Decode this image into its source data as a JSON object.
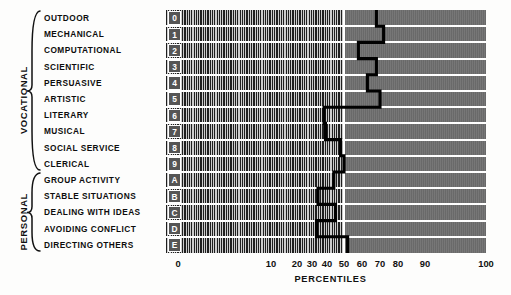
{
  "groups": [
    {
      "name": "VOCATIONAL",
      "start_row": 0,
      "end_row": 9
    },
    {
      "name": "PERSONAL",
      "start_row": 10,
      "end_row": 14
    }
  ],
  "rows": [
    {
      "code": "0",
      "label": "OUTDOOR"
    },
    {
      "code": "1",
      "label": "MECHANICAL"
    },
    {
      "code": "2",
      "label": "COMPUTATIONAL"
    },
    {
      "code": "3",
      "label": "SCIENTIFIC"
    },
    {
      "code": "4",
      "label": "PERSUASIVE"
    },
    {
      "code": "5",
      "label": "ARTISTIC"
    },
    {
      "code": "6",
      "label": "LITERARY"
    },
    {
      "code": "7",
      "label": "MUSICAL"
    },
    {
      "code": "8",
      "label": "SOCIAL SERVICE"
    },
    {
      "code": "9",
      "label": "CLERICAL"
    },
    {
      "code": "A",
      "label": "GROUP ACTIVITY"
    },
    {
      "code": "B",
      "label": "STABLE SITUATIONS"
    },
    {
      "code": "C",
      "label": "DEALING WITH IDEAS"
    },
    {
      "code": "D",
      "label": "AVOIDING CONFLICT"
    },
    {
      "code": "E",
      "label": "DIRECTING OTHERS"
    }
  ],
  "axis": {
    "title": "PERCENTILES",
    "ticks": [
      0,
      10,
      20,
      30,
      40,
      50,
      60,
      70,
      80,
      90,
      100
    ],
    "tick_px": [
      178,
      271,
      297,
      312,
      327,
      344,
      362,
      380,
      398,
      425,
      486
    ],
    "median_value": 50
  },
  "colors": {
    "band_dark": "#1c1c1c",
    "band_light": "#cfcfcf",
    "panel_gray": "#6e6e6e",
    "separator": "#ffffff",
    "profile_line": "#000000",
    "code_box": "#555555"
  },
  "chart_data": {
    "type": "line",
    "title": "",
    "xlabel": "PERCENTILES",
    "ylabel": "",
    "xlim": [
      0,
      100
    ],
    "orientation": "horizontal",
    "grid": true,
    "legend": null,
    "scale": "normal-probability",
    "categories": [
      "OUTDOOR",
      "MECHANICAL",
      "COMPUTATIONAL",
      "SCIENTIFIC",
      "PERSUASIVE",
      "ARTISTIC",
      "LITERARY",
      "MUSICAL",
      "SOCIAL SERVICE",
      "CLERICAL",
      "GROUP ACTIVITY",
      "STABLE SITUATIONS",
      "DEALING WITH IDEAS",
      "AVOIDING CONFLICT",
      "DIRECTING OTHERS"
    ],
    "codes": [
      "0",
      "1",
      "2",
      "3",
      "4",
      "5",
      "6",
      "7",
      "8",
      "9",
      "A",
      "B",
      "C",
      "D",
      "E"
    ],
    "values": [
      68,
      72,
      58,
      68,
      63,
      70,
      38,
      39,
      48,
      50,
      44,
      34,
      45,
      33,
      52
    ],
    "annotations": [
      "VOCATIONAL",
      "PERSONAL"
    ]
  }
}
